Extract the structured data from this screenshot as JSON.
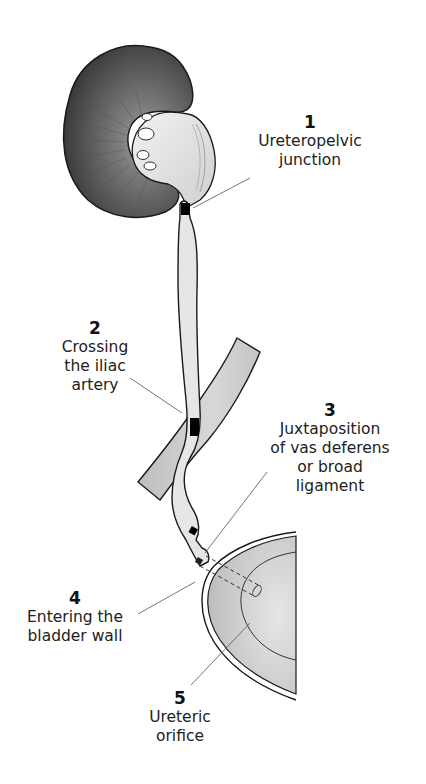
{
  "diagram": {
    "type": "anatomical-illustration",
    "structures": [
      "kidney",
      "ureter",
      "iliac artery",
      "bladder"
    ],
    "colors": {
      "kidney_dark": "#3a3a3a",
      "kidney_mid": "#7a7a7a",
      "pelvis_fill": "#dcdcdc",
      "ureter_fill": "#e4e4e4",
      "artery_fill": "#cfcfcf",
      "bladder_fill": "#c9c9c9",
      "constriction_mark": "#000000",
      "outline": "#1a1a1a",
      "leader_line": "#666666"
    }
  },
  "labels": [
    {
      "number": "1",
      "text": "Ureteropelvic\njunction"
    },
    {
      "number": "2",
      "text": "Crossing\nthe iliac\nartery"
    },
    {
      "number": "3",
      "text": "Juxtaposition\nof vas deferens\nor broad\nligament"
    },
    {
      "number": "4",
      "text": "Entering the\nbladder wall"
    },
    {
      "number": "5",
      "text": "Ureteric\norifice"
    }
  ]
}
